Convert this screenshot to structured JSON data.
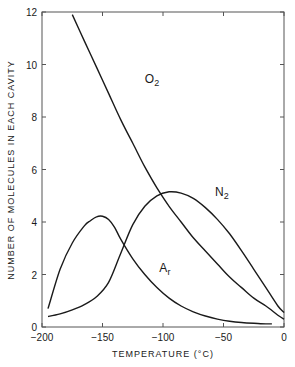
{
  "chart_data": {
    "type": "line",
    "title": "",
    "xlabel": "TEMPERATURE (°C)",
    "ylabel": "NUMBER OF MOLECULES IN EACH CAVITY",
    "xlim": [
      -200,
      0
    ],
    "ylim": [
      0,
      12
    ],
    "xticks": [
      -200,
      -150,
      -100,
      -50,
      0
    ],
    "xtick_labels": [
      "-200",
      "-150",
      "-100",
      "-50",
      "0"
    ],
    "yticks": [
      0,
      2,
      4,
      6,
      8,
      10,
      12
    ],
    "ytick_labels": [
      "0",
      "2",
      "4",
      "6",
      "8",
      "10",
      "12"
    ],
    "grid": false,
    "legend": "inline labels on curves",
    "series": [
      {
        "name": "O2",
        "label_main": "O",
        "label_sub": "2",
        "x": [
          -175,
          -165,
          -155,
          -145,
          -135,
          -125,
          -115,
          -105,
          -95,
          -85,
          -75,
          -65,
          -55,
          -45,
          -35,
          -25,
          -15,
          -5,
          0
        ],
        "y": [
          11.9,
          10.9,
          9.9,
          8.9,
          7.9,
          7.0,
          6.1,
          5.3,
          4.6,
          4.0,
          3.4,
          2.9,
          2.4,
          1.9,
          1.5,
          1.1,
          0.8,
          0.45,
          0.3
        ]
      },
      {
        "name": "N2",
        "label_main": "N",
        "label_sub": "2",
        "x": [
          -195,
          -185,
          -175,
          -165,
          -155,
          -145,
          -135,
          -125,
          -115,
          -105,
          -95,
          -85,
          -75,
          -65,
          -55,
          -45,
          -35,
          -25,
          -15,
          -5,
          0
        ],
        "y": [
          0.4,
          0.5,
          0.65,
          0.85,
          1.15,
          1.7,
          2.8,
          3.9,
          4.6,
          5.0,
          5.15,
          5.1,
          4.9,
          4.55,
          4.1,
          3.55,
          2.9,
          2.2,
          1.5,
          0.8,
          0.55
        ]
      },
      {
        "name": "Ar",
        "label_main": "A",
        "label_sub": "r",
        "x": [
          -195,
          -185,
          -175,
          -165,
          -160,
          -155,
          -150,
          -145,
          -140,
          -135,
          -125,
          -115,
          -105,
          -95,
          -85,
          -75,
          -65,
          -55,
          -45,
          -35,
          -25,
          -15,
          -10
        ],
        "y": [
          0.7,
          2.2,
          3.2,
          3.85,
          4.05,
          4.2,
          4.22,
          4.1,
          3.8,
          3.35,
          2.6,
          2.0,
          1.5,
          1.1,
          0.8,
          0.58,
          0.42,
          0.3,
          0.22,
          0.17,
          0.14,
          0.12,
          0.12
        ]
      }
    ],
    "annotations": [
      {
        "text": "O2",
        "x": -115,
        "y": 9.3
      },
      {
        "text": "N2",
        "x": -57,
        "y": 5.0
      },
      {
        "text": "Ar",
        "x": -103,
        "y": 2.1
      }
    ]
  }
}
